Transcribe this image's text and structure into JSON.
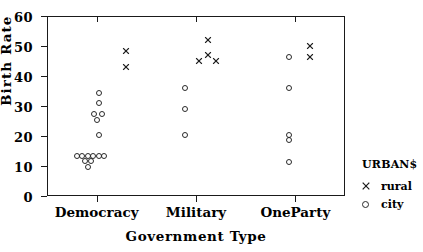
{
  "chart_data": {
    "type": "scatter",
    "title": "",
    "xlabel": "Government Type",
    "ylabel": "Birth Rate",
    "categories": [
      "Democracy",
      "Military",
      "OneParty"
    ],
    "ylim": [
      0,
      60
    ],
    "yticks": [
      0,
      10,
      20,
      30,
      40,
      50,
      60
    ],
    "grid": false,
    "legend": {
      "title": "URBAN$",
      "position": "right",
      "entries": [
        {
          "label": "rural",
          "marker": "cross-marker"
        },
        {
          "label": "city",
          "marker": "circle-marker"
        }
      ]
    },
    "series": [
      {
        "name": "rural",
        "marker": "cross-marker",
        "points": [
          {
            "category": "Democracy",
            "offset": 0.3,
            "y": 48.5
          },
          {
            "category": "Democracy",
            "offset": 0.3,
            "y": 43.0
          },
          {
            "category": "Military",
            "offset": 0.12,
            "y": 52.0
          },
          {
            "category": "Military",
            "offset": 0.12,
            "y": 47.0
          },
          {
            "category": "Military",
            "offset": 0.03,
            "y": 45.0
          },
          {
            "category": "Military",
            "offset": 0.2,
            "y": 45.0
          },
          {
            "category": "OneParty",
            "offset": 0.15,
            "y": 50.0
          },
          {
            "category": "OneParty",
            "offset": 0.15,
            "y": 46.5
          }
        ]
      },
      {
        "name": "city",
        "marker": "circle-marker",
        "points": [
          {
            "category": "Democracy",
            "offset": 0.02,
            "y": 34.5
          },
          {
            "category": "Democracy",
            "offset": 0.02,
            "y": 31.0
          },
          {
            "category": "Democracy",
            "offset": -0.03,
            "y": 27.2
          },
          {
            "category": "Democracy",
            "offset": 0.05,
            "y": 27.2
          },
          {
            "category": "Democracy",
            "offset": 0.0,
            "y": 25.5
          },
          {
            "category": "Democracy",
            "offset": 0.02,
            "y": 20.3
          },
          {
            "category": "Democracy",
            "offset": -0.2,
            "y": 13.2
          },
          {
            "category": "Democracy",
            "offset": -0.145,
            "y": 13.2
          },
          {
            "category": "Democracy",
            "offset": -0.09,
            "y": 13.2
          },
          {
            "category": "Democracy",
            "offset": -0.035,
            "y": 13.2
          },
          {
            "category": "Democracy",
            "offset": 0.02,
            "y": 13.2
          },
          {
            "category": "Democracy",
            "offset": 0.075,
            "y": 13.2
          },
          {
            "category": "Democracy",
            "offset": -0.115,
            "y": 11.6
          },
          {
            "category": "Democracy",
            "offset": -0.06,
            "y": 11.6
          },
          {
            "category": "Democracy",
            "offset": -0.085,
            "y": 9.8
          },
          {
            "category": "Military",
            "offset": -0.11,
            "y": 36.0
          },
          {
            "category": "Military",
            "offset": -0.11,
            "y": 29.0
          },
          {
            "category": "Military",
            "offset": -0.11,
            "y": 20.2
          },
          {
            "category": "OneParty",
            "offset": -0.06,
            "y": 46.5
          },
          {
            "category": "OneParty",
            "offset": -0.06,
            "y": 36.0
          },
          {
            "category": "OneParty",
            "offset": -0.06,
            "y": 20.2
          },
          {
            "category": "OneParty",
            "offset": -0.06,
            "y": 18.6
          },
          {
            "category": "OneParty",
            "offset": -0.06,
            "y": 11.2
          }
        ]
      }
    ]
  }
}
